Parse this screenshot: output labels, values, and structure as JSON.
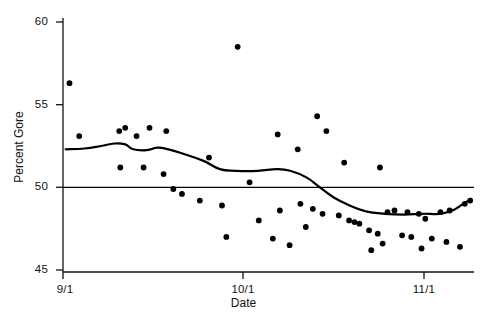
{
  "chart_data": {
    "type": "scatter",
    "title": "",
    "xlabel": "Date",
    "ylabel": "Percent Gore",
    "xlim": [
      0,
      76
    ],
    "ylim": [
      45,
      60
    ],
    "grid": false,
    "legend": null,
    "x_tick_values": [
      0,
      30,
      61
    ],
    "x_tick_labels": [
      "9/1",
      "10/1",
      "11/1"
    ],
    "y_tick_values": [
      45,
      50,
      55,
      60
    ],
    "y_tick_labels": [
      "45",
      "50",
      "55",
      "60"
    ],
    "x_unit": "days since 9/1",
    "series": [
      {
        "name": "poll results",
        "type": "scatter",
        "marker": "filled-circle",
        "color": "#000000",
        "points": [
          [
            1.2,
            56.3
          ],
          [
            3.0,
            53.1
          ],
          [
            10.4,
            53.4
          ],
          [
            10.6,
            51.2
          ],
          [
            14.9,
            51.2
          ],
          [
            18.6,
            50.8
          ],
          [
            11.5,
            53.6
          ],
          [
            13.6,
            53.1
          ],
          [
            16.0,
            53.6
          ],
          [
            19.1,
            53.4
          ],
          [
            32.3,
            58.5
          ],
          [
            20.4,
            49.9
          ],
          [
            22.0,
            49.6
          ],
          [
            25.3,
            49.2
          ],
          [
            39.7,
            53.2
          ],
          [
            43.4,
            52.3
          ],
          [
            47.0,
            54.3
          ],
          [
            48.7,
            53.4
          ],
          [
            52.0,
            51.5
          ],
          [
            58.6,
            51.2
          ],
          [
            34.5,
            50.3
          ],
          [
            36.2,
            48.0
          ],
          [
            40.1,
            48.6
          ],
          [
            43.9,
            49.0
          ],
          [
            46.2,
            48.7
          ],
          [
            48.0,
            48.4
          ],
          [
            51.0,
            48.3
          ],
          [
            52.9,
            48.0
          ],
          [
            53.9,
            47.9
          ],
          [
            56.6,
            47.4
          ],
          [
            58.2,
            47.2
          ],
          [
            60.0,
            48.5
          ],
          [
            61.3,
            48.6
          ],
          [
            63.7,
            48.5
          ],
          [
            65.8,
            48.4
          ],
          [
            67.0,
            48.1
          ],
          [
            69.8,
            48.5
          ],
          [
            71.5,
            48.6
          ],
          [
            74.3,
            49.0
          ],
          [
            75.3,
            49.2
          ],
          [
            30.2,
            47.0
          ],
          [
            38.8,
            46.9
          ],
          [
            41.9,
            46.5
          ],
          [
            62.7,
            47.1
          ],
          [
            64.4,
            47.0
          ],
          [
            68.2,
            46.9
          ],
          [
            59.1,
            46.6
          ],
          [
            66.3,
            46.3
          ],
          [
            70.9,
            46.7
          ],
          [
            73.4,
            46.4
          ],
          [
            57.0,
            46.2
          ],
          [
            29.4,
            48.9
          ],
          [
            27.0,
            51.8
          ],
          [
            44.9,
            47.6
          ],
          [
            54.8,
            47.8
          ]
        ]
      },
      {
        "name": "smoothed trend",
        "type": "line",
        "color": "#000000",
        "linewidth": 2.2,
        "points": [
          [
            0.5,
            52.3
          ],
          [
            4.0,
            52.35
          ],
          [
            7.0,
            52.5
          ],
          [
            9.5,
            52.65
          ],
          [
            11.5,
            52.6
          ],
          [
            13.0,
            52.3
          ],
          [
            15.5,
            52.25
          ],
          [
            17.5,
            52.4
          ],
          [
            19.5,
            52.3
          ],
          [
            22.5,
            52.0
          ],
          [
            26.0,
            51.6
          ],
          [
            29.0,
            51.1
          ],
          [
            32.0,
            51.0
          ],
          [
            36.0,
            51.0
          ],
          [
            39.5,
            51.1
          ],
          [
            42.0,
            51.0
          ],
          [
            45.0,
            50.6
          ],
          [
            47.5,
            50.0
          ],
          [
            50.0,
            49.4
          ],
          [
            53.0,
            48.9
          ],
          [
            56.0,
            48.55
          ],
          [
            59.5,
            48.4
          ],
          [
            63.0,
            48.35
          ],
          [
            66.5,
            48.4
          ],
          [
            69.5,
            48.4
          ],
          [
            72.0,
            48.6
          ],
          [
            74.0,
            49.0
          ],
          [
            75.5,
            49.3
          ]
        ]
      },
      {
        "name": "50 percent reference line",
        "type": "hline",
        "color": "#000000",
        "linewidth": 1.4,
        "y": 50.0
      }
    ]
  },
  "axes": {
    "x_title": "Date",
    "y_title": "Percent Gore"
  }
}
